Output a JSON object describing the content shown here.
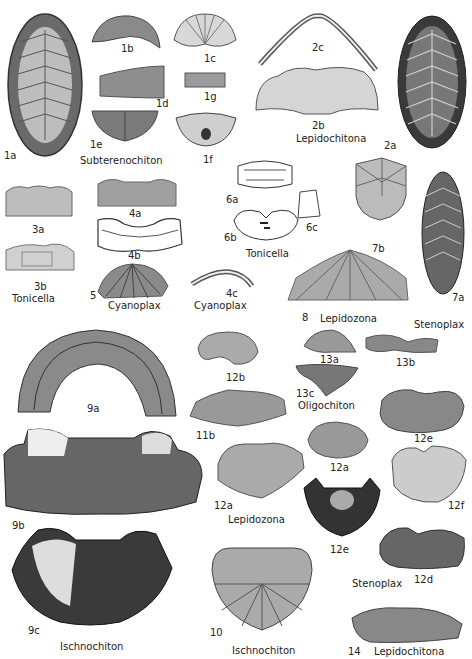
{
  "plate": {
    "figures": [
      {
        "id": "1a",
        "label": "1a"
      },
      {
        "id": "1b",
        "label": "1b"
      },
      {
        "id": "1c",
        "label": "1c"
      },
      {
        "id": "1d",
        "label": "1d"
      },
      {
        "id": "1e",
        "label": "1e"
      },
      {
        "id": "1f",
        "label": "1f"
      },
      {
        "id": "1g",
        "label": "1g"
      },
      {
        "id": "2a",
        "label": "2a"
      },
      {
        "id": "2b",
        "label": "2b"
      },
      {
        "id": "2c",
        "label": "2c"
      },
      {
        "id": "3a",
        "label": "3a"
      },
      {
        "id": "3b",
        "label": "3b"
      },
      {
        "id": "4a",
        "label": "4a"
      },
      {
        "id": "4b",
        "label": "4b"
      },
      {
        "id": "4c",
        "label": "4c"
      },
      {
        "id": "5",
        "label": "5"
      },
      {
        "id": "6a",
        "label": "6a"
      },
      {
        "id": "6b",
        "label": "6b"
      },
      {
        "id": "6c",
        "label": "6c"
      },
      {
        "id": "7a",
        "label": "7a"
      },
      {
        "id": "7b",
        "label": "7b"
      },
      {
        "id": "8",
        "label": "8"
      },
      {
        "id": "9a",
        "label": "9a"
      },
      {
        "id": "9b",
        "label": "9b"
      },
      {
        "id": "9c",
        "label": "9c"
      },
      {
        "id": "10",
        "label": "10"
      },
      {
        "id": "11a",
        "label": "11a"
      },
      {
        "id": "11b",
        "label": "11b"
      },
      {
        "id": "12a",
        "label": "12a"
      },
      {
        "id": "12b",
        "label": "12b"
      },
      {
        "id": "12c",
        "label": "12c"
      },
      {
        "id": "12d",
        "label": "12d"
      },
      {
        "id": "12e",
        "label": "12e"
      },
      {
        "id": "12f",
        "label": "12f"
      },
      {
        "id": "13a",
        "label": "13a"
      },
      {
        "id": "13b",
        "label": "13b"
      },
      {
        "id": "13c",
        "label": "13c"
      },
      {
        "id": "14",
        "label": "14"
      }
    ],
    "genera": {
      "subterenochiton": "Subterenochiton",
      "lepidochitona_2": "Lepidochitona",
      "tonicella_3": "Tonicella",
      "cyanoplax_5": "Cyanoplax",
      "cyanoplax_4c": "Cyanoplax",
      "tonicella_6": "Tonicella",
      "lepidozona_8": "Lepidozona",
      "stenoplax_7": "Stenoplax",
      "oligochiton": "Oligochiton",
      "lepidozona_11": "Lepidozona",
      "stenoplax_12": "Stenoplax",
      "ischnochiton_9": "Ischnochiton",
      "ischnochiton_10": "Ischnochiton",
      "lepidochitona_14": "Lepidochitona"
    }
  }
}
